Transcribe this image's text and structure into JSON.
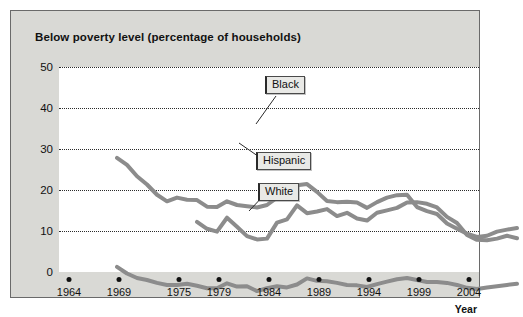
{
  "figure": {
    "title": "Below poverty level (percentage of households)",
    "axis_title_x": "Year"
  },
  "callouts": {
    "black": "Black",
    "hispanic": "Hispanic",
    "white": "White"
  },
  "chart_data": {
    "type": "line",
    "title": "Below poverty level (percentage of households)",
    "xlabel": "Year",
    "ylabel": "",
    "xlim": [
      1963,
      2005
    ],
    "ylim": [
      0,
      50
    ],
    "grid": true,
    "legend_position": "inline-callouts",
    "line_color": "#8c8c8c",
    "xtick_labels": [
      "1964",
      "1969",
      "1975",
      "1979",
      "1984",
      "1989",
      "1994",
      "1999",
      "2004"
    ],
    "xtick_values": [
      1964,
      1969,
      1975,
      1979,
      1984,
      1989,
      1994,
      1999,
      2004
    ],
    "ytick_labels": [
      "0",
      "10",
      "20",
      "30",
      "40",
      "50"
    ],
    "ytick_values": [
      0,
      10,
      20,
      30,
      40,
      50
    ],
    "series": [
      {
        "name": "Black",
        "x": [
          1964,
          1965,
          1966,
          1967,
          1968,
          1969,
          1970,
          1971,
          1972,
          1973,
          1974,
          1975,
          1976,
          1977,
          1978,
          1979,
          1980,
          1981,
          1982,
          1983,
          1984,
          1985,
          1986,
          1987,
          1988,
          1989,
          1990,
          1991,
          1992,
          1993,
          1994,
          1995,
          1996,
          1997,
          1998,
          1999,
          2000,
          2001,
          2002,
          2003,
          2004
        ],
        "values": [
          41.5,
          39.8,
          37.0,
          35.0,
          32.5,
          30.9,
          31.8,
          31.3,
          31.2,
          29.6,
          29.5,
          30.9,
          30.0,
          29.7,
          29.4,
          30.0,
          31.8,
          33.0,
          34.8,
          35.1,
          33.2,
          31.0,
          30.7,
          30.8,
          30.6,
          29.3,
          30.7,
          31.8,
          32.4,
          32.5,
          29.5,
          28.5,
          27.8,
          25.5,
          24.2,
          23.0,
          22.2,
          22.5,
          23.5,
          24.0,
          24.4
        ]
      },
      {
        "name": "Hispanic",
        "x": [
          1972,
          1973,
          1974,
          1975,
          1976,
          1977,
          1978,
          1979,
          1980,
          1981,
          1982,
          1983,
          1984,
          1985,
          1986,
          1987,
          1988,
          1989,
          1990,
          1991,
          1992,
          1993,
          1994,
          1995,
          1996,
          1997,
          1998,
          1999,
          2000,
          2001,
          2002,
          2003,
          2004
        ],
        "values": [
          25.9,
          24.2,
          23.5,
          26.9,
          24.7,
          22.4,
          21.6,
          21.8,
          25.7,
          26.5,
          29.9,
          28.0,
          28.4,
          29.0,
          27.3,
          28.1,
          26.7,
          26.2,
          28.1,
          28.7,
          29.3,
          30.6,
          30.7,
          30.3,
          29.4,
          27.1,
          25.6,
          22.7,
          21.5,
          21.4,
          21.8,
          22.5,
          21.9
        ]
      },
      {
        "name": "White",
        "x": [
          1964,
          1965,
          1966,
          1967,
          1968,
          1969,
          1970,
          1971,
          1972,
          1973,
          1974,
          1975,
          1976,
          1977,
          1978,
          1979,
          1980,
          1981,
          1982,
          1983,
          1984,
          1985,
          1986,
          1987,
          1988,
          1989,
          1990,
          1991,
          1992,
          1993,
          1994,
          1995,
          1996,
          1997,
          1998,
          1999,
          2000,
          2001,
          2002,
          2003,
          2004
        ],
        "values": [
          14.9,
          13.3,
          12.2,
          11.7,
          11.0,
          10.5,
          10.5,
          10.8,
          10.3,
          9.7,
          9.7,
          10.9,
          10.1,
          10.2,
          9.0,
          9.7,
          10.2,
          9.9,
          10.6,
          12.1,
          11.5,
          11.4,
          11.0,
          10.5,
          10.4,
          10.0,
          10.7,
          11.3,
          11.9,
          12.2,
          11.7,
          11.2,
          11.2,
          11.0,
          10.5,
          9.8,
          9.5,
          9.9,
          10.2,
          10.5,
          10.8
        ]
      }
    ]
  }
}
